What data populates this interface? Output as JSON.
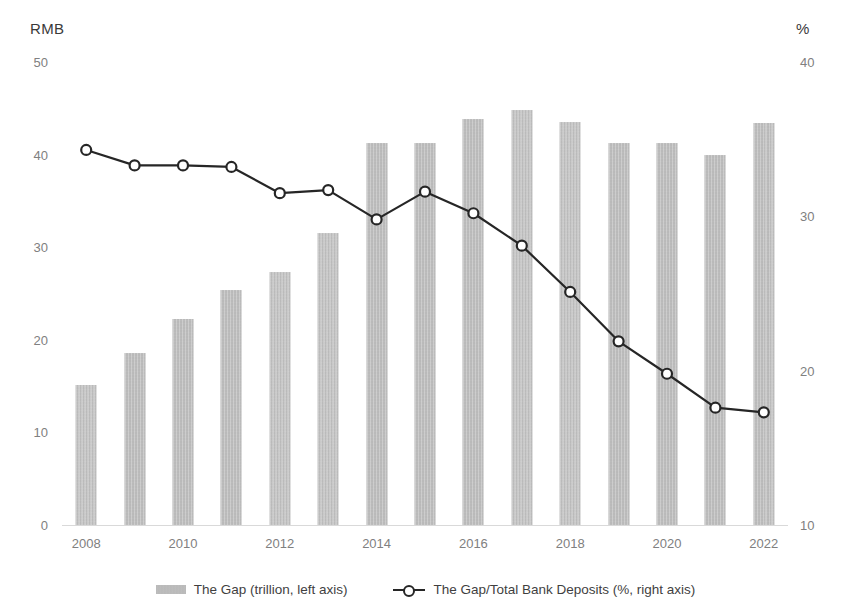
{
  "chart_data": {
    "type": "bar",
    "title": "",
    "xlabel": "",
    "ylabel": "RMB",
    "y2label": "%",
    "grid": false,
    "legend_position": "bottom",
    "categories": [
      "2008",
      "2009",
      "2010",
      "2011",
      "2012",
      "2013",
      "2014",
      "2015",
      "2016",
      "2017",
      "2018",
      "2019",
      "2020",
      "2021",
      "2022"
    ],
    "x_tick_labels": [
      "2008",
      "2010",
      "2012",
      "2014",
      "2016",
      "2018",
      "2020",
      "2022"
    ],
    "left_axis": {
      "label": "RMB",
      "ticks": [
        "0",
        "10",
        "20",
        "30",
        "40",
        "50"
      ],
      "tick_values": [
        0,
        10,
        20,
        30,
        40,
        50
      ],
      "ylim": [
        0,
        50
      ]
    },
    "right_axis": {
      "label": "%",
      "ticks": [
        "10",
        "20",
        "30",
        "40"
      ],
      "tick_values": [
        10,
        20,
        30,
        40
      ],
      "ylim": [
        10,
        40
      ]
    },
    "series": [
      {
        "name": "The Gap (trillion, left axis)",
        "type": "bar",
        "axis": "left",
        "color": "#b9b9b9",
        "values": [
          15.1,
          18.6,
          22.3,
          25.4,
          27.3,
          31.5,
          41.3,
          41.3,
          43.9,
          44.8,
          43.5,
          41.3,
          41.3,
          40.0,
          43.4
        ]
      },
      {
        "name": "The Gap/Total Bank Deposits (%, right axis)",
        "type": "line",
        "axis": "right",
        "color": "#262626",
        "marker": "circle-open",
        "values": [
          34.3,
          33.3,
          33.3,
          33.2,
          31.5,
          31.7,
          29.8,
          31.6,
          30.2,
          28.1,
          25.1,
          21.9,
          19.8,
          17.6,
          17.3
        ]
      }
    ]
  },
  "legend": {
    "entries": [
      {
        "label": "The Gap (trillion, left axis)",
        "icon": "bar-swatch-icon"
      },
      {
        "label": "The Gap/Total Bank Deposits (%, right axis)",
        "icon": "line-marker-swatch-icon"
      }
    ]
  }
}
